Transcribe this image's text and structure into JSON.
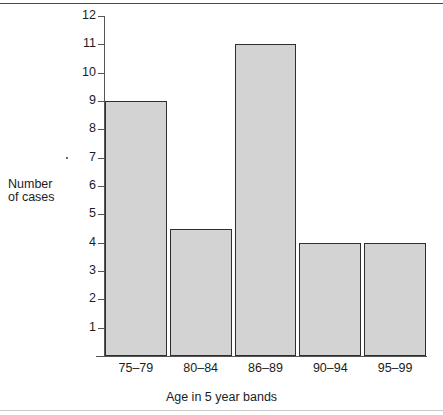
{
  "chart_data": {
    "type": "bar",
    "title": "",
    "xlabel": "Age in 5 year bands",
    "ylabel_line1": "Number",
    "ylabel_line2": "of cases",
    "categories": [
      "75–79",
      "80–84",
      "86–89",
      "90–94",
      "95–99"
    ],
    "values": [
      9,
      4.5,
      11,
      4,
      4
    ],
    "ylim": [
      0,
      12
    ],
    "ytick_labels": [
      "1",
      "2",
      "3",
      "4",
      "5",
      "6",
      "7",
      "8",
      "9",
      "10",
      "11",
      "12"
    ],
    "ytick_values": [
      1,
      2,
      3,
      4,
      5,
      6,
      7,
      8,
      9,
      10,
      11,
      12
    ],
    "grid": false,
    "legend": false,
    "bar_fill_color": "#d3d3d3",
    "bar_edge_color": "#2e2e2e",
    "axis_color": "#555555",
    "text_color": "#1c1c1c"
  }
}
